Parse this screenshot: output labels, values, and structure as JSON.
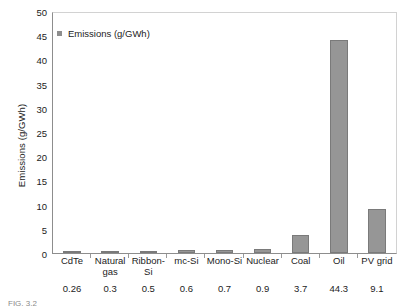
{
  "chart_data": {
    "type": "bar",
    "title": "",
    "xlabel": "",
    "ylabel": "Emissions (g/GWh)",
    "ylim": [
      0,
      50
    ],
    "yticks": [
      50,
      45,
      40,
      35,
      30,
      25,
      20,
      15,
      10,
      5,
      0
    ],
    "grid": false,
    "legend": {
      "position": "top-left",
      "entries": [
        "Emissions (g/GWh)"
      ]
    },
    "series": [
      {
        "name": "Emissions (g/GWh)",
        "color": "#969696",
        "values": [
          0.26,
          0.3,
          0.5,
          0.6,
          0.7,
          0.9,
          3.7,
          44.3,
          9.1
        ]
      }
    ],
    "categories": [
      "CdTe",
      "Natural gas",
      "Ribbon-Si",
      "mc-Si",
      "Mono-Si",
      "Nuclear",
      "Coal",
      "Oil",
      "PV grid"
    ],
    "value_labels": [
      "0.26",
      "0.3",
      "0.5",
      "0.6",
      "0.7",
      "0.9",
      "3.7",
      "44.3",
      "9.1"
    ]
  },
  "caption": {
    "text": "FIG. 3.2"
  }
}
